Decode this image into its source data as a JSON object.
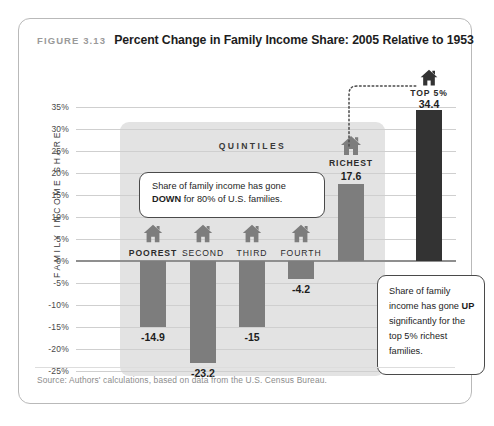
{
  "figure": {
    "number": "FIGURE 3.13",
    "title": "Percent Change in Family Income Share: 2005 Relative to 1953",
    "source": "Source: Authors' calculations, based on data from the U.S. Census Bureau."
  },
  "band": {
    "label": "QUINTILES"
  },
  "callouts": {
    "down": {
      "text_before": "Share of family income has gone ",
      "emphasis": "DOWN",
      "text_after": " for 80% of U.S. families."
    },
    "up": {
      "text_before": "Share of family income has gone ",
      "emphasis": "UP",
      "text_after": " significantly for the top 5% richest families."
    }
  },
  "colors": {
    "bar_gray": "#7d7d7d",
    "bar_dark": "#333333",
    "band": "#e3e3e3",
    "gridline": "#cfcfcf",
    "zero_line": "#8f8f8f"
  },
  "chart_data": {
    "type": "bar",
    "title": "Percent Change in Family Income Share: 2005 Relative to 1953",
    "xlabel": "",
    "ylabel": "FAMILY INCOME SHARE",
    "ylim": [
      -25,
      35
    ],
    "ytick_labels": [
      "35%",
      "30%",
      "25%",
      "20%",
      "15%",
      "10%",
      "5%",
      "0%",
      "-5%",
      "-10%",
      "-15%",
      "-20%",
      "-25%"
    ],
    "ytick_values": [
      35,
      30,
      25,
      20,
      15,
      10,
      5,
      0,
      -5,
      -10,
      -15,
      -20,
      -25
    ],
    "grid": true,
    "legend": "none",
    "categories": [
      "POOREST",
      "SECOND",
      "THIRD",
      "FOURTH",
      "RICHEST",
      "TOP 5%"
    ],
    "values": [
      -14.9,
      -23.2,
      -15,
      -4.2,
      17.6,
      34.4
    ],
    "value_labels": [
      "-14.9",
      "-23.2",
      "-15",
      "-4.2",
      "17.6",
      "34.4"
    ],
    "annotations": [
      "QUINTILES",
      "Share of family income has gone DOWN for 80% of U.S. families.",
      "Share of family income has gone UP significantly for the top 5% richest families."
    ]
  }
}
